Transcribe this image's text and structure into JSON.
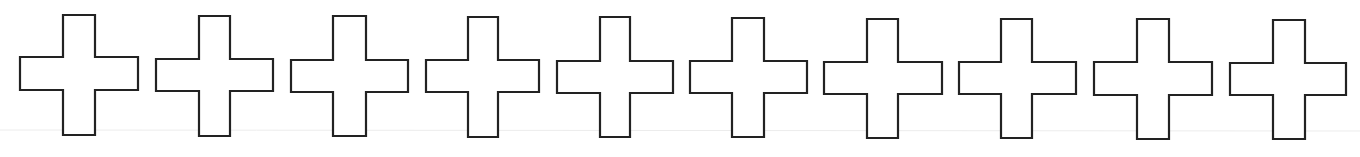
{
  "figure": {
    "stroke_color": "#222222",
    "fill_color": "#ffffff",
    "background": "#ffffff",
    "baseline_color": "#ececec",
    "crosses": [
      {
        "hx1": 20,
        "hx2": 138,
        "vx1": 63,
        "vx2": 95,
        "top": 15,
        "hy1": 57,
        "hy2": 90,
        "bottom": 135
      },
      {
        "hx1": 156,
        "hx2": 273,
        "vx1": 199,
        "vx2": 230,
        "top": 16,
        "hy1": 59,
        "hy2": 91,
        "bottom": 136
      },
      {
        "hx1": 291,
        "hx2": 408,
        "vx1": 333,
        "vx2": 366,
        "top": 16,
        "hy1": 60,
        "hy2": 92,
        "bottom": 136
      },
      {
        "hx1": 426,
        "hx2": 539,
        "vx1": 468,
        "vx2": 498,
        "top": 17,
        "hy1": 60,
        "hy2": 92,
        "bottom": 137
      },
      {
        "hx1": 557,
        "hx2": 673,
        "vx1": 600,
        "vx2": 630,
        "top": 17,
        "hy1": 61,
        "hy2": 93,
        "bottom": 137
      },
      {
        "hx1": 690,
        "hx2": 807,
        "vx1": 732,
        "vx2": 764,
        "top": 18,
        "hy1": 61,
        "hy2": 93,
        "bottom": 137
      },
      {
        "hx1": 824,
        "hx2": 942,
        "vx1": 867,
        "vx2": 898,
        "top": 19,
        "hy1": 62,
        "hy2": 94,
        "bottom": 138
      },
      {
        "hx1": 959,
        "hx2": 1076,
        "vx1": 1001,
        "vx2": 1032,
        "top": 19,
        "hy1": 62,
        "hy2": 94,
        "bottom": 138
      },
      {
        "hx1": 1094,
        "hx2": 1212,
        "vx1": 1137,
        "vx2": 1169,
        "top": 19,
        "hy1": 62,
        "hy2": 95,
        "bottom": 139
      },
      {
        "hx1": 1230,
        "hx2": 1346,
        "vx1": 1273,
        "vx2": 1305,
        "top": 20,
        "hy1": 63,
        "hy2": 95,
        "bottom": 139
      }
    ]
  }
}
